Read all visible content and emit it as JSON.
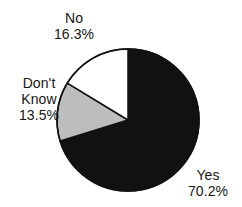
{
  "chart_data": {
    "type": "pie",
    "title": "",
    "xlabel": "",
    "ylabel": "",
    "legend": "none",
    "grid": false,
    "start_angle_deg": 0,
    "direction": "clockwise",
    "categories": [
      "Yes",
      "No",
      "Don't Know"
    ],
    "values": [
      70.2,
      16.3,
      13.5
    ],
    "unit": "%",
    "slices": [
      {
        "label": "Yes",
        "value": 70.2,
        "value_text": "70.2%",
        "color": "#111111",
        "start_deg": 0,
        "end_deg": 252.72,
        "label_position": "bottom-right"
      },
      {
        "label": "Don't Know",
        "label_line1": "Don't",
        "label_line2": "Know",
        "value": 13.5,
        "value_text": "13.5%",
        "color": "#bdbdbd",
        "start_deg": 252.72,
        "end_deg": 301.32,
        "label_position": "left"
      },
      {
        "label": "No",
        "value": 16.3,
        "value_text": "16.3%",
        "color": "#ffffff",
        "start_deg": 301.32,
        "end_deg": 360,
        "label_position": "top-left"
      }
    ],
    "geometry": {
      "center_x": 128,
      "center_y": 120,
      "radius": 71
    },
    "style": {
      "outline_color": "#111111",
      "outline_width": 1.5,
      "background": "#ffffff",
      "text_color": "#161616"
    }
  }
}
